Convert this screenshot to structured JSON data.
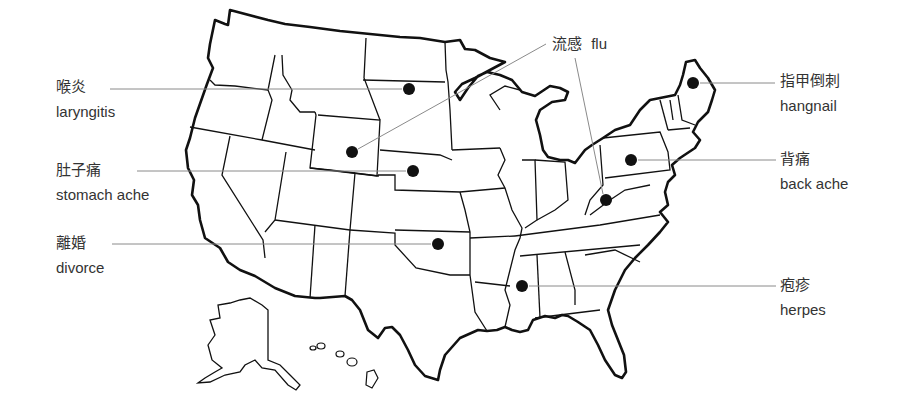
{
  "map": {
    "title": "US map of ailments by state",
    "dot_color": "#111111",
    "leader_color": "#8a8a8a",
    "outline_color": "#111111"
  },
  "labels": [
    {
      "id": "laryngitis",
      "zh": "喉炎",
      "en": "laryngitis",
      "state": "North Dakota",
      "dot": [
        409,
        89
      ]
    },
    {
      "id": "stomach-ache",
      "zh": "肚子痛",
      "en": "stomach ache",
      "state": "Nebraska",
      "dot": [
        413,
        171
      ]
    },
    {
      "id": "divorce",
      "zh": "離婚",
      "en": "divorce",
      "state": "Oklahoma",
      "dot": [
        438,
        244
      ]
    },
    {
      "id": "flu",
      "zh": "流感",
      "en": "flu",
      "state": "Wyoming / West Virginia",
      "dots": [
        [
          352,
          152
        ],
        [
          606,
          200
        ]
      ]
    },
    {
      "id": "hangnail",
      "zh": "指甲倒刺",
      "en": "hangnail",
      "state": "Maine",
      "dot": [
        693,
        83
      ]
    },
    {
      "id": "back-ache",
      "zh": "背痛",
      "en": "back ache",
      "state": "Pennsylvania",
      "dot": [
        631,
        160
      ]
    },
    {
      "id": "herpes",
      "zh": "疱疹",
      "en": "herpes",
      "state": "Mississippi",
      "dot": [
        522,
        286
      ]
    }
  ]
}
